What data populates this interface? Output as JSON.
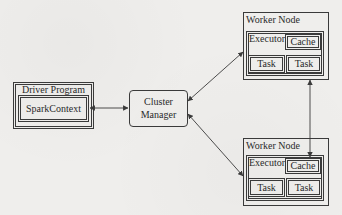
{
  "diagram": {
    "driver": {
      "label": "Driver Program",
      "context_label": "SparkContext"
    },
    "cluster_manager": {
      "label_line1": "Cluster",
      "label_line2": "Manager"
    },
    "workers": [
      {
        "label": "Worker Node",
        "executor_label": "Executor",
        "cache_label": "Cache",
        "tasks": [
          "Task",
          "Task"
        ]
      },
      {
        "label": "Worker Node",
        "executor_label": "Executor",
        "cache_label": "Cache",
        "tasks": [
          "Task",
          "Task"
        ]
      }
    ],
    "edges": [
      {
        "from": "SparkContext",
        "to": "Cluster Manager",
        "type": "bidirectional"
      },
      {
        "from": "Cluster Manager",
        "to": "Worker Node 1",
        "type": "bidirectional"
      },
      {
        "from": "Cluster Manager",
        "to": "Worker Node 2",
        "type": "bidirectional"
      },
      {
        "from": "Worker Node 1",
        "to": "Worker Node 2 Cache",
        "type": "bidirectional"
      }
    ],
    "colors": {
      "line": "#3a3a3a",
      "background": "#eeedeb"
    }
  }
}
